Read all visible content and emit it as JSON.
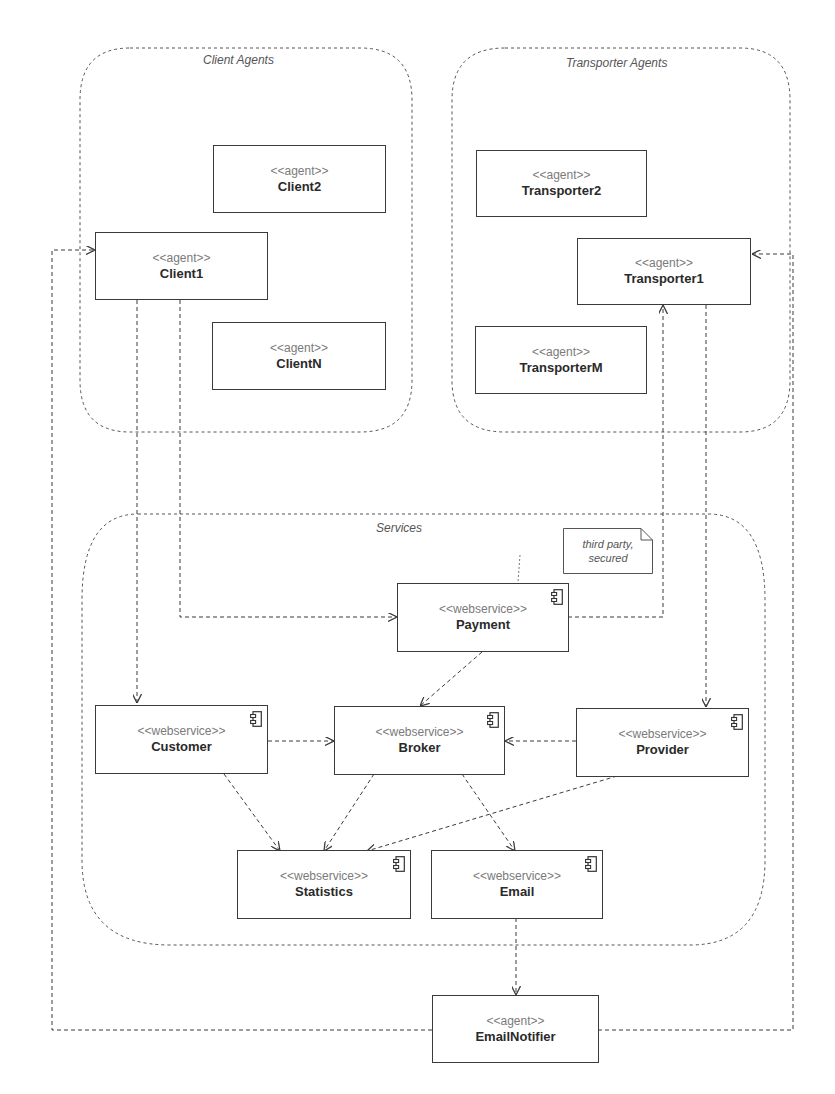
{
  "groups": {
    "client_agents": "Client Agents",
    "transporter_agents": "Transporter Agents",
    "services": "Services"
  },
  "agents": {
    "stereotype": "<<agent>>",
    "client2": "Client2",
    "client1": "Client1",
    "clientN": "ClientN",
    "transporter2": "Transporter2",
    "transporter1": "Transporter1",
    "transporterM": "TransporterM",
    "email_notifier": "EmailNotifier"
  },
  "services": {
    "stereotype": "<<webservice>>",
    "payment": "Payment",
    "customer": "Customer",
    "broker": "Broker",
    "provider": "Provider",
    "statistics": "Statistics",
    "email": "Email"
  },
  "note": {
    "line1": "third party,",
    "line2": "secured"
  },
  "icons": {
    "component": "component-icon"
  },
  "colors": {
    "line": "#3a3a3a",
    "group_border": "#555555",
    "stereotype_text": "#7a7a7a"
  }
}
